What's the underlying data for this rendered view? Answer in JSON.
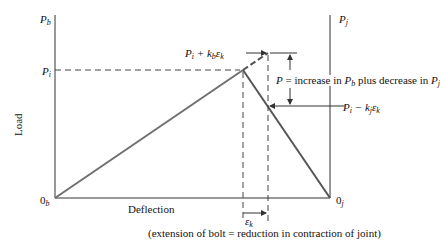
{
  "diagram": {
    "axes": {
      "left_axis_label": {
        "main": "P",
        "sub": "b"
      },
      "right_axis_label": {
        "main": "P",
        "sub": "j"
      },
      "y_label": "Load",
      "x_label": "Deflection",
      "origin_left": {
        "main": "0",
        "sub": "b"
      },
      "origin_right": {
        "main": "0",
        "sub": "j"
      }
    },
    "levels": {
      "preload": {
        "main": "P",
        "sub": "i"
      },
      "bolt_load": {
        "prefix": "P",
        "prefix_sub": "i",
        "mid": " + k",
        "mid_sub": "b",
        "tail": "ε",
        "tail_sub": "k"
      },
      "joint_load": {
        "prefix": "P",
        "prefix_sub": "i",
        "mid": " − k",
        "mid_sub": "j",
        "tail": "ε",
        "tail_sub": "k"
      }
    },
    "annotation": {
      "p_label_start": "P = increase in ",
      "p_label_pb": "P",
      "p_label_pb_sub": "b",
      "p_label_mid": " plus decrease in ",
      "p_label_pj": "P",
      "p_label_pj_sub": "j"
    },
    "extension": {
      "main": "ε",
      "sub": "k"
    },
    "caption": "(extension of bolt = reduction in contraction of joint)",
    "colors": {
      "axis": "#333333",
      "bolt_line": "#707070",
      "joint_line": "#555555",
      "dashed": "#444444"
    }
  }
}
